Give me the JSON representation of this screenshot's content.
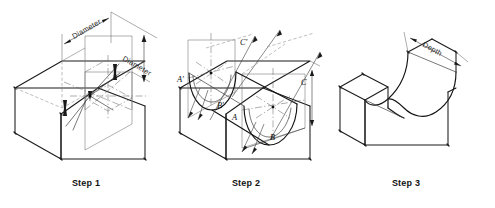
{
  "figure": {
    "background_color": "#ffffff",
    "line_color": "#1a1a1a",
    "construction_line_color": "#6d6d6d",
    "width": 495,
    "height": 208
  },
  "steps": [
    {
      "id": "step-1",
      "caption": "Step 1",
      "description": "Isometric box with centre lines and two Diameter dimensions laid out on the top and end faces",
      "dimensions": [
        {
          "name": "diameter-top",
          "label": "Diameter",
          "rotation": -31
        },
        {
          "name": "diameter-side",
          "label": "Diameter",
          "rotation": 31
        }
      ]
    },
    {
      "id": "step-2",
      "caption": "Step 2",
      "description": "Construction of elliptical arcs through plotted points using offset measurements",
      "point_labels": [
        {
          "name": "point-a-prime",
          "label": "A'"
        },
        {
          "name": "point-b-prime",
          "label": "B'"
        },
        {
          "name": "point-c-prime",
          "label": "C'"
        },
        {
          "name": "point-a",
          "label": "A"
        },
        {
          "name": "point-b",
          "label": "B"
        },
        {
          "name": "point-c",
          "label": "C"
        }
      ]
    },
    {
      "id": "step-3",
      "caption": "Step 3",
      "description": "Finished isometric block with the semicircular channel cut through and the Depth dimension shown",
      "dimensions": [
        {
          "name": "depth-top",
          "label": "Depth",
          "rotation": -31
        }
      ]
    }
  ]
}
